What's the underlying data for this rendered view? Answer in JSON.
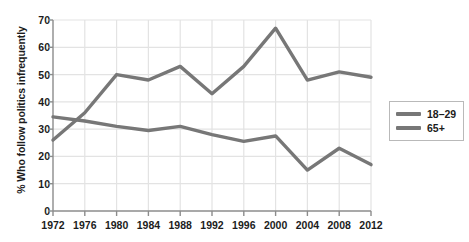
{
  "chart_data": {
    "type": "line",
    "title": "",
    "xlabel": "",
    "ylabel": "% Who follow politics infrequently",
    "x": [
      1972,
      1976,
      1980,
      1984,
      1988,
      1992,
      1996,
      2000,
      2004,
      2008,
      2012
    ],
    "xtick_labels": [
      "1972",
      "1976",
      "1980",
      "1984",
      "1988",
      "1992",
      "1996",
      "2000",
      "2004",
      "2008",
      "2012"
    ],
    "ytick_labels": [
      "0",
      "10",
      "20",
      "30",
      "40",
      "50",
      "60",
      "70"
    ],
    "ytick_values": [
      0,
      10,
      20,
      30,
      40,
      50,
      60,
      70
    ],
    "ylim": [
      0,
      70
    ],
    "grid": true,
    "legend_position": "right-outside",
    "series": [
      {
        "name": "18–29",
        "color": "#777777",
        "values": [
          26,
          36,
          50,
          48,
          53,
          43,
          53,
          67,
          48,
          51,
          49
        ]
      },
      {
        "name": "65+",
        "color": "#777777",
        "values": [
          34.5,
          33,
          31,
          29.5,
          31,
          28,
          25.5,
          27.5,
          15,
          23,
          17
        ]
      }
    ]
  },
  "legend": {
    "entries": [
      {
        "label": "18–29"
      },
      {
        "label": "65+"
      }
    ]
  },
  "style": {
    "grid_color": "#e3e3e3",
    "axis_color": "#8c8c8c",
    "line_color": "#777777",
    "text_color": "#1c1c1c",
    "background": "#ffffff"
  }
}
